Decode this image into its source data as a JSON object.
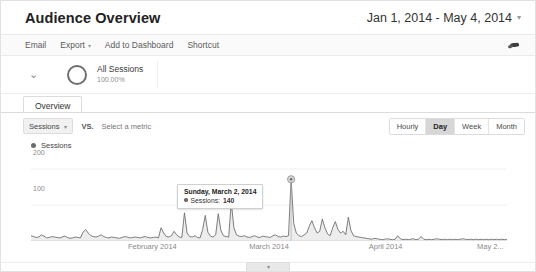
{
  "header": {
    "title": "Audience Overview",
    "date_range": "Jan 1, 2014 - May 4, 2014",
    "caret": "▾"
  },
  "toolbar": {
    "email": "Email",
    "export": "Export",
    "export_caret": "▾",
    "add_to_dashboard": "Add to Dashboard",
    "shortcut": "Shortcut",
    "share_icon": "share-icon"
  },
  "segment": {
    "chevron": "⌄",
    "name": "All Sessions",
    "percent": "100.00%",
    "ring_icon": "donut-ring-icon"
  },
  "tabs": [
    {
      "label": "Overview",
      "active": true
    }
  ],
  "metric_bar": {
    "selected_metric": "Sessions",
    "metric_caret": "▾",
    "vs_label": "VS.",
    "compare_placeholder": "Select a metric",
    "granularity": [
      {
        "label": "Hourly",
        "active": false
      },
      {
        "label": "Day",
        "active": true
      },
      {
        "label": "Week",
        "active": false
      },
      {
        "label": "Month",
        "active": false
      }
    ]
  },
  "legend": {
    "label": "Sessions",
    "color": "#6b6b6b"
  },
  "tooltip": {
    "date": "Sunday, March 2, 2014",
    "metric_label": "Sessions:",
    "value": "140"
  },
  "footer": {
    "collapse_caret": "▾"
  },
  "chart_data": {
    "type": "line",
    "title": "Sessions",
    "xlabel": "",
    "ylabel": "Sessions",
    "ylim": [
      0,
      200
    ],
    "yticks": [
      100,
      200
    ],
    "ytick_labels": [
      "100",
      "200"
    ],
    "grid": false,
    "legend": [
      "Sessions"
    ],
    "legend_position": "top-left",
    "fill": true,
    "line_color": "#6b6b6b",
    "fill_color": "#ebebeb",
    "highlight": {
      "x": "2014-03-02",
      "y": 140,
      "label": "Sunday, March 2, 2014"
    },
    "xtick_labels": [
      "February 2014",
      "March 2014",
      "April 2014",
      "May 2..."
    ],
    "xtick_positions": [
      0.255,
      0.5,
      0.745,
      0.965
    ],
    "x_start": "2014-01-01",
    "x_end": "2014-05-04",
    "series": [
      {
        "name": "Sessions",
        "values": [
          12,
          10,
          8,
          9,
          14,
          11,
          7,
          8,
          10,
          9,
          8,
          7,
          9,
          11,
          8,
          6,
          7,
          9,
          8,
          7,
          20,
          26,
          18,
          12,
          10,
          9,
          11,
          14,
          10,
          8,
          7,
          9,
          8,
          7,
          6,
          8,
          10,
          9,
          7,
          8,
          9,
          8,
          7,
          9,
          10,
          8,
          7,
          8,
          9,
          7,
          30,
          18,
          10,
          9,
          12,
          22,
          14,
          9,
          8,
          64,
          18,
          10,
          9,
          12,
          8,
          7,
          26,
          58,
          20,
          11,
          9,
          14,
          62,
          24,
          12,
          10,
          9,
          88,
          30,
          14,
          11,
          10,
          12,
          9,
          8,
          10,
          12,
          9,
          8,
          11,
          10,
          9,
          8,
          12,
          14,
          10,
          9,
          11,
          10,
          12,
          140,
          40,
          18,
          12,
          10,
          14,
          18,
          34,
          46,
          30,
          18,
          22,
          50,
          30,
          16,
          12,
          30,
          44,
          26,
          18,
          22,
          14,
          54,
          24,
          12,
          10,
          9,
          8,
          7,
          6,
          5,
          4,
          6,
          5,
          4,
          3,
          4,
          5,
          4,
          3,
          4,
          12,
          5,
          3,
          4,
          3,
          4,
          5,
          3,
          4,
          10,
          4,
          3,
          4,
          3,
          4,
          5,
          4,
          3,
          4,
          3,
          4,
          3,
          4,
          3,
          4,
          5,
          4,
          3,
          4,
          3,
          4,
          3,
          4,
          3,
          4,
          3,
          4,
          3,
          4,
          3,
          4,
          3,
          4
        ]
      }
    ]
  }
}
